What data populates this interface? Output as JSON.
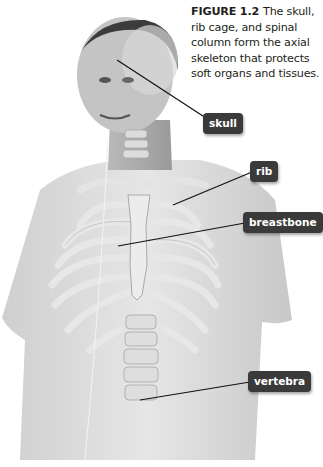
{
  "caption": {
    "figure_number": "FIGURE 1.2",
    "text": "The skull, rib cage, and spinal column form the axial skeleton that protects soft organs and tissues."
  },
  "labels": [
    {
      "id": "skull",
      "text": "skull"
    },
    {
      "id": "rib",
      "text": "rib"
    },
    {
      "id": "breastbone",
      "text": "breastbone"
    },
    {
      "id": "vertebra",
      "text": "vertebra"
    }
  ],
  "colors": {
    "label_bg": "#3a3a3a",
    "label_text": "#ffffff",
    "caption_text": "#231f20"
  }
}
